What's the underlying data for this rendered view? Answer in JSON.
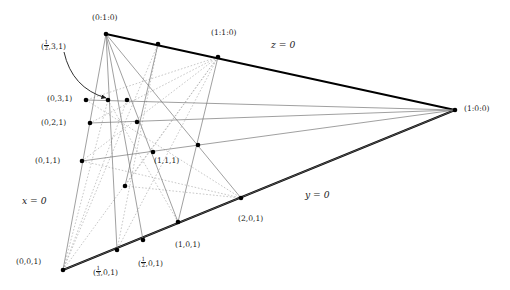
{
  "figure": {
    "type": "projective-plane-point-line-diagram",
    "background": "#ffffff",
    "colors": {
      "edge_bold": "#000000",
      "line_solid": "#777777",
      "line_solid_dark": "#555555",
      "line_dotted": "#aaaaaa",
      "point": "#000000",
      "text": "#1a1a1a"
    }
  },
  "vertices": {
    "top": {
      "label": "(0:1:0)",
      "x": 106,
      "y": 34
    },
    "right": {
      "label": "(1:0:0)",
      "x": 455,
      "y": 110
    },
    "bottom_left": {
      "label": "(0,0,1)",
      "x": 63,
      "y": 270
    }
  },
  "edge_labels": {
    "top_edge": "z = 0",
    "left_edge": "x = 0",
    "bottom_edge": "y = 0"
  },
  "labels": [
    {
      "name": "label-0-1-0",
      "text": "(0:1:0)",
      "x": 92,
      "y": 14,
      "italic": false
    },
    {
      "name": "label-1-1-0",
      "text": "(1:1:0)",
      "x": 211,
      "y": 29,
      "italic": false
    },
    {
      "name": "label-z-eq-0",
      "text": "z = 0",
      "x": 271,
      "y": 40,
      "italic": true
    },
    {
      "name": "label-1-0-0",
      "text": "(1:0:0)",
      "x": 464,
      "y": 105,
      "italic": false
    },
    {
      "name": "label-half-3-1",
      "text": "FRAC",
      "x": 41,
      "y": 40,
      "italic": false
    },
    {
      "name": "label-0-3-1",
      "text": "(0,3,1)",
      "x": 47,
      "y": 95,
      "italic": false
    },
    {
      "name": "label-0-2-1",
      "text": "(0,2,1)",
      "x": 41,
      "y": 119,
      "italic": false
    },
    {
      "name": "label-0-1-1",
      "text": "(0,1,1)",
      "x": 35,
      "y": 157,
      "italic": false
    },
    {
      "name": "label-1-1-1",
      "text": "(1,1,1)",
      "x": 154,
      "y": 157,
      "italic": false
    },
    {
      "name": "label-x-eq-0",
      "text": "x = 0",
      "x": 22,
      "y": 196,
      "italic": true
    },
    {
      "name": "label-y-eq-0",
      "text": "y = 0",
      "x": 305,
      "y": 190,
      "italic": true
    },
    {
      "name": "label-2-0-1",
      "text": "(2,0,1)",
      "x": 238,
      "y": 215,
      "italic": false
    },
    {
      "name": "label-1-0-1",
      "text": "(1,0,1)",
      "x": 175,
      "y": 241,
      "italic": false
    },
    {
      "name": "label-0-0-1",
      "text": "(0,0,1)",
      "x": 16,
      "y": 258,
      "italic": false
    }
  ],
  "fraction_labels": [
    {
      "name": "label-half-3-1",
      "prefix": "(",
      "num": "1",
      "den": "2",
      "suffix": ",3,1)",
      "x": 41,
      "y": 40
    },
    {
      "name": "label-third-0-1",
      "prefix": "(",
      "num": "1",
      "den": "3",
      "suffix": ",0,1)",
      "x": 93,
      "y": 266
    },
    {
      "name": "label-half-0-1",
      "prefix": "(",
      "num": "1",
      "den": "2",
      "suffix": ",0,1)",
      "x": 138,
      "y": 257
    }
  ],
  "points": [
    {
      "name": "pt-0-1-0",
      "x": 106,
      "y": 34
    },
    {
      "name": "pt-top-a",
      "x": 158,
      "y": 44
    },
    {
      "name": "pt-1-1-0",
      "x": 218,
      "y": 57
    },
    {
      "name": "pt-1-0-0",
      "x": 455,
      "y": 110
    },
    {
      "name": "pt-0-3-1",
      "x": 86,
      "y": 100
    },
    {
      "name": "pt-h3-a",
      "x": 108,
      "y": 100
    },
    {
      "name": "pt-h3-b",
      "x": 127,
      "y": 100
    },
    {
      "name": "pt-0-2-1",
      "x": 90,
      "y": 123
    },
    {
      "name": "pt-h2-a",
      "x": 137,
      "y": 122
    },
    {
      "name": "pt-0-1-1",
      "x": 82,
      "y": 161
    },
    {
      "name": "pt-1-1-1",
      "x": 153,
      "y": 152
    },
    {
      "name": "pt-h1-a",
      "x": 198,
      "y": 145
    },
    {
      "name": "pt-center",
      "x": 125,
      "y": 186
    },
    {
      "name": "pt-0-0-1",
      "x": 63,
      "y": 270
    },
    {
      "name": "pt-third",
      "x": 117,
      "y": 250
    },
    {
      "name": "pt-half",
      "x": 143,
      "y": 240
    },
    {
      "name": "pt-1-0-1",
      "x": 178,
      "y": 222
    },
    {
      "name": "pt-2-0-1",
      "x": 241,
      "y": 198
    }
  ],
  "solid_lines": [
    {
      "name": "line-top-edge",
      "x1": 106,
      "y1": 34,
      "x2": 455,
      "y2": 110,
      "bold": true
    },
    {
      "name": "line-left-edge",
      "x1": 106,
      "y1": 34,
      "x2": 63,
      "y2": 270,
      "bold": false
    },
    {
      "name": "line-bottom-edge",
      "x1": 63,
      "y1": 270,
      "x2": 455,
      "y2": 110,
      "bold": true
    },
    {
      "name": "line-h3",
      "x1": 86,
      "y1": 100,
      "x2": 455,
      "y2": 110
    },
    {
      "name": "line-h2",
      "x1": 90,
      "y1": 123,
      "x2": 455,
      "y2": 110
    },
    {
      "name": "line-h1",
      "x1": 82,
      "y1": 161,
      "x2": 455,
      "y2": 110
    },
    {
      "name": "line-apex-1",
      "x1": 106,
      "y1": 34,
      "x2": 117,
      "y2": 250
    },
    {
      "name": "line-apex-2",
      "x1": 106,
      "y1": 34,
      "x2": 143,
      "y2": 240
    },
    {
      "name": "line-apex-3",
      "x1": 106,
      "y1": 34,
      "x2": 178,
      "y2": 222
    },
    {
      "name": "line-apex-4",
      "x1": 106,
      "y1": 34,
      "x2": 241,
      "y2": 198
    },
    {
      "name": "line-v-110-101",
      "x1": 218,
      "y1": 57,
      "x2": 178,
      "y2": 222
    },
    {
      "name": "line-v-top-half",
      "x1": 158,
      "y1": 44,
      "x2": 125,
      "y2": 186
    },
    {
      "name": "line-right-down",
      "x1": 455,
      "y1": 110,
      "x2": 63,
      "y2": 270
    }
  ],
  "dotted_lines": [
    {
      "name": "dot-1",
      "x1": 63,
      "y1": 270,
      "x2": 158,
      "y2": 44
    },
    {
      "name": "dot-2",
      "x1": 63,
      "y1": 270,
      "x2": 218,
      "y2": 57
    },
    {
      "name": "dot-3",
      "x1": 63,
      "y1": 270,
      "x2": 127,
      "y2": 100
    },
    {
      "name": "dot-4",
      "x1": 63,
      "y1": 270,
      "x2": 108,
      "y2": 100
    },
    {
      "name": "dot-5",
      "x1": 218,
      "y1": 57,
      "x2": 86,
      "y2": 100
    },
    {
      "name": "dot-6",
      "x1": 218,
      "y1": 57,
      "x2": 90,
      "y2": 123
    },
    {
      "name": "dot-7",
      "x1": 218,
      "y1": 57,
      "x2": 82,
      "y2": 161
    },
    {
      "name": "dot-8",
      "x1": 218,
      "y1": 57,
      "x2": 125,
      "y2": 186
    },
    {
      "name": "dot-9",
      "x1": 218,
      "y1": 57,
      "x2": 117,
      "y2": 250
    },
    {
      "name": "dot-10",
      "x1": 158,
      "y1": 44,
      "x2": 117,
      "y2": 250
    },
    {
      "name": "dot-11",
      "x1": 86,
      "y1": 100,
      "x2": 241,
      "y2": 198
    },
    {
      "name": "dot-12",
      "x1": 108,
      "y1": 100,
      "x2": 178,
      "y2": 222
    },
    {
      "name": "dot-13",
      "x1": 82,
      "y1": 161,
      "x2": 241,
      "y2": 198
    },
    {
      "name": "dot-14",
      "x1": 125,
      "y1": 186,
      "x2": 241,
      "y2": 198
    }
  ],
  "annotation_arrow": {
    "name": "pointer-arrow-half-3-1",
    "from_x": 64,
    "from_y": 52,
    "ctrl_x": 72,
    "ctrl_y": 88,
    "to_x": 106,
    "to_y": 98
  }
}
